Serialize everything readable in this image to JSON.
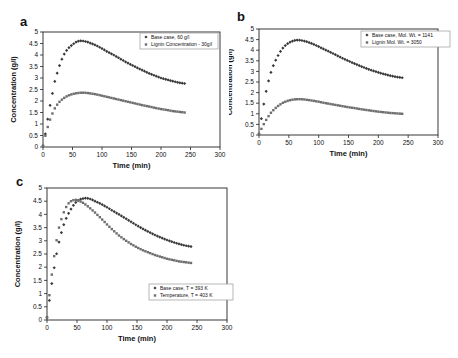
{
  "figure": {
    "background": "#ffffff",
    "axis_color": "#222222",
    "text_color": "#111111",
    "legend_border_color": "#999999"
  },
  "chart_data": [
    {
      "type": "scatter",
      "panel_label": "a",
      "xlabel": "Time (min)",
      "ylabel": "Concentration (g/l)",
      "xlim": [
        0,
        300
      ],
      "ylim": [
        0,
        5
      ],
      "xticks": [
        0,
        50,
        100,
        150,
        200,
        250,
        300
      ],
      "yticks": [
        0,
        0.5,
        1,
        1.5,
        2,
        2.5,
        3,
        3.5,
        4,
        4.5,
        5
      ],
      "legend_position": "top-right",
      "series": [
        {
          "name": "Base case, 60 g/l",
          "marker": "diamond",
          "color": "#383838",
          "x": [
            0,
            5,
            10,
            15,
            20,
            25,
            30,
            35,
            40,
            45,
            50,
            55,
            60,
            65,
            70,
            75,
            80,
            90,
            100,
            110,
            120,
            130,
            140,
            150,
            160,
            170,
            180,
            190,
            200,
            210,
            220,
            230,
            240
          ],
          "y": [
            0.05,
            0.7,
            1.55,
            2.2,
            2.85,
            3.3,
            3.7,
            4.0,
            4.2,
            4.35,
            4.45,
            4.55,
            4.6,
            4.62,
            4.6,
            4.57,
            4.52,
            4.42,
            4.28,
            4.13,
            4.0,
            3.85,
            3.7,
            3.57,
            3.44,
            3.32,
            3.2,
            3.1,
            3.0,
            2.93,
            2.86,
            2.8,
            2.76
          ]
        },
        {
          "name": "Lignin Concentration - 30g/l",
          "marker": "square",
          "color": "#6e6e6e",
          "x": [
            0,
            5,
            10,
            15,
            20,
            25,
            30,
            35,
            40,
            45,
            50,
            55,
            60,
            65,
            70,
            75,
            80,
            90,
            100,
            110,
            120,
            130,
            140,
            150,
            160,
            170,
            180,
            190,
            200,
            210,
            220,
            230,
            240
          ],
          "y": [
            0.05,
            0.6,
            1.05,
            1.4,
            1.68,
            1.88,
            2.02,
            2.12,
            2.2,
            2.26,
            2.3,
            2.33,
            2.35,
            2.36,
            2.36,
            2.35,
            2.33,
            2.29,
            2.23,
            2.17,
            2.11,
            2.05,
            1.99,
            1.93,
            1.87,
            1.81,
            1.76,
            1.7,
            1.65,
            1.61,
            1.56,
            1.53,
            1.5
          ]
        }
      ]
    },
    {
      "type": "scatter",
      "panel_label": "b",
      "xlabel": "Time (min)",
      "ylabel": "Concentration (g/l)",
      "xlim": [
        0,
        300
      ],
      "ylim": [
        0,
        5
      ],
      "xticks": [
        0,
        50,
        100,
        150,
        200,
        250,
        300
      ],
      "yticks": [
        0,
        0.5,
        1,
        1.5,
        2,
        2.5,
        3,
        3.5,
        4,
        4.5,
        5
      ],
      "legend_position": "top-right",
      "series": [
        {
          "name": "Base case, Mol. Wt. = 1141",
          "marker": "diamond",
          "color": "#383838",
          "x": [
            0,
            5,
            10,
            15,
            20,
            25,
            30,
            35,
            40,
            45,
            50,
            55,
            60,
            65,
            70,
            75,
            80,
            90,
            100,
            110,
            120,
            130,
            140,
            150,
            160,
            170,
            180,
            190,
            200,
            210,
            220,
            230,
            240
          ],
          "y": [
            0.05,
            0.95,
            1.8,
            2.45,
            2.95,
            3.35,
            3.65,
            3.9,
            4.1,
            4.25,
            4.35,
            4.42,
            4.46,
            4.48,
            4.47,
            4.44,
            4.4,
            4.3,
            4.17,
            4.03,
            3.9,
            3.76,
            3.62,
            3.49,
            3.37,
            3.25,
            3.14,
            3.04,
            2.95,
            2.87,
            2.8,
            2.74,
            2.7
          ]
        },
        {
          "name": "Lignin Mol. Wt. = 3050",
          "marker": "square",
          "color": "#6e6e6e",
          "x": [
            0,
            5,
            10,
            15,
            20,
            25,
            30,
            35,
            40,
            45,
            50,
            55,
            60,
            65,
            70,
            75,
            80,
            90,
            100,
            110,
            120,
            130,
            140,
            150,
            160,
            170,
            180,
            190,
            200,
            210,
            220,
            230,
            240
          ],
          "y": [
            0.05,
            0.35,
            0.62,
            0.85,
            1.05,
            1.2,
            1.33,
            1.43,
            1.52,
            1.58,
            1.63,
            1.66,
            1.68,
            1.69,
            1.69,
            1.68,
            1.66,
            1.62,
            1.57,
            1.51,
            1.46,
            1.41,
            1.36,
            1.31,
            1.27,
            1.22,
            1.18,
            1.14,
            1.1,
            1.07,
            1.04,
            1.02,
            1.0
          ]
        }
      ]
    },
    {
      "type": "scatter",
      "panel_label": "c",
      "xlabel": "Time (min)",
      "ylabel": "Concentration (g/l)",
      "xlim": [
        0,
        300
      ],
      "ylim": [
        0,
        5
      ],
      "xticks": [
        0,
        50,
        100,
        150,
        200,
        250,
        300
      ],
      "yticks": [
        0,
        0.5,
        1,
        1.5,
        2,
        2.5,
        3,
        3.5,
        4,
        4.5,
        5
      ],
      "legend_position": "bottom-right",
      "series": [
        {
          "name": "Base case, T = 393 K",
          "marker": "diamond",
          "color": "#383838",
          "x": [
            0,
            5,
            10,
            15,
            20,
            25,
            30,
            35,
            40,
            45,
            50,
            55,
            60,
            65,
            70,
            75,
            80,
            90,
            100,
            110,
            120,
            130,
            140,
            150,
            160,
            170,
            180,
            190,
            200,
            210,
            220,
            230,
            240
          ],
          "y": [
            0.1,
            0.9,
            1.7,
            2.4,
            2.95,
            3.4,
            3.75,
            4.0,
            4.2,
            4.38,
            4.5,
            4.57,
            4.6,
            4.62,
            4.6,
            4.56,
            4.5,
            4.4,
            4.27,
            4.13,
            4.0,
            3.86,
            3.72,
            3.58,
            3.45,
            3.33,
            3.22,
            3.12,
            3.03,
            2.95,
            2.88,
            2.82,
            2.78
          ]
        },
        {
          "name": "Temperature, T = 403 K",
          "marker": "square",
          "color": "#6e6e6e",
          "x": [
            0,
            5,
            10,
            15,
            20,
            25,
            30,
            35,
            40,
            45,
            50,
            55,
            60,
            65,
            70,
            75,
            80,
            90,
            100,
            110,
            120,
            130,
            140,
            150,
            160,
            170,
            180,
            190,
            200,
            210,
            220,
            230,
            240
          ],
          "y": [
            0.1,
            1.15,
            2.1,
            2.9,
            3.5,
            3.9,
            4.2,
            4.4,
            4.5,
            4.55,
            4.55,
            4.5,
            4.44,
            4.36,
            4.27,
            4.17,
            4.07,
            3.85,
            3.62,
            3.4,
            3.2,
            3.03,
            2.88,
            2.75,
            2.64,
            2.55,
            2.46,
            2.39,
            2.32,
            2.27,
            2.22,
            2.19,
            2.16
          ]
        }
      ]
    }
  ]
}
